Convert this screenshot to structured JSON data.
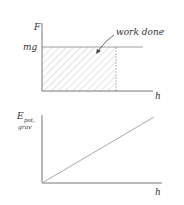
{
  "diagram": {
    "top_graph": {
      "y_axis_label": "F",
      "y_value_label": "mg",
      "x_axis_label": "h",
      "annotation": "work done",
      "description": "Constant force mg vs height h; shaded rectangle under line represents work done"
    },
    "bottom_graph": {
      "y_axis_label_main": "E",
      "y_axis_label_sub1": "pot,",
      "y_axis_label_sub2": "grav",
      "x_axis_label": "h",
      "description": "Gravitational potential energy increases linearly with height h"
    },
    "colors": {
      "axis": "#555555",
      "hatch": "#b0b0b0",
      "line": "#aaaaaa",
      "text": "#333333"
    }
  }
}
